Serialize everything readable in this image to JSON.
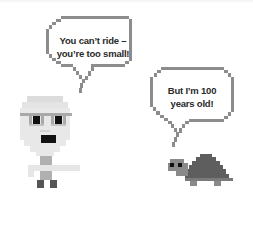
{
  "scene": {
    "background": "#ffffff",
    "characters": [
      {
        "name": "old-man",
        "description": "Pixel-art elderly man with glasses and open mouth"
      },
      {
        "name": "turtle",
        "description": "Pixel-art turtle with dark gray shell"
      }
    ]
  },
  "bubbles": {
    "old_man": {
      "line1": "You can’t ride –",
      "line2": "you’re too small!"
    },
    "turtle": {
      "line1": "But I’m 100",
      "line2": "years old!"
    }
  },
  "colors": {
    "bubble_border": "#8c8c8c",
    "skin": "#e6e6e6",
    "glasses": "#a9a9a9",
    "eyes": "#111111",
    "mouth": "#111111",
    "body": "#b0b0b0",
    "feet": "#555555",
    "turtle_shell": "#5e5e5e",
    "turtle_skin": "#8a8a8a"
  }
}
